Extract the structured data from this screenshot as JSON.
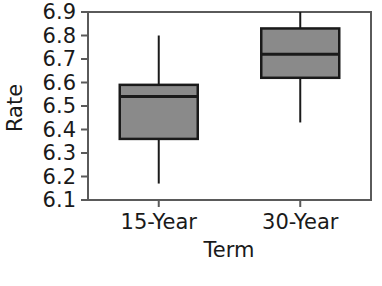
{
  "chart_data": {
    "type": "box",
    "title": "",
    "xlabel": "Term",
    "ylabel": "Rate",
    "categories": [
      "15-Year",
      "30-Year"
    ],
    "ylim": [
      6.1,
      6.9
    ],
    "yticks": [
      "6.1",
      "6.2",
      "6.3",
      "6.4",
      "6.5",
      "6.6",
      "6.7",
      "6.8",
      "6.9"
    ],
    "ytick_values": [
      6.1,
      6.2,
      6.3,
      6.4,
      6.5,
      6.6,
      6.7,
      6.8,
      6.9
    ],
    "grid": false,
    "legend": "none",
    "box_fill": "#8a8a8a",
    "box_stroke": "#1a1a1a",
    "frame_color": "#5a5a5a",
    "boxes": [
      {
        "label": "15-Year",
        "whisker_low": 6.17,
        "q1": 6.36,
        "median": 6.54,
        "q3": 6.59,
        "whisker_high": 6.8
      },
      {
        "label": "30-Year",
        "whisker_low": 6.43,
        "q1": 6.62,
        "median": 6.72,
        "q3": 6.83,
        "whisker_high": 6.9
      }
    ]
  }
}
